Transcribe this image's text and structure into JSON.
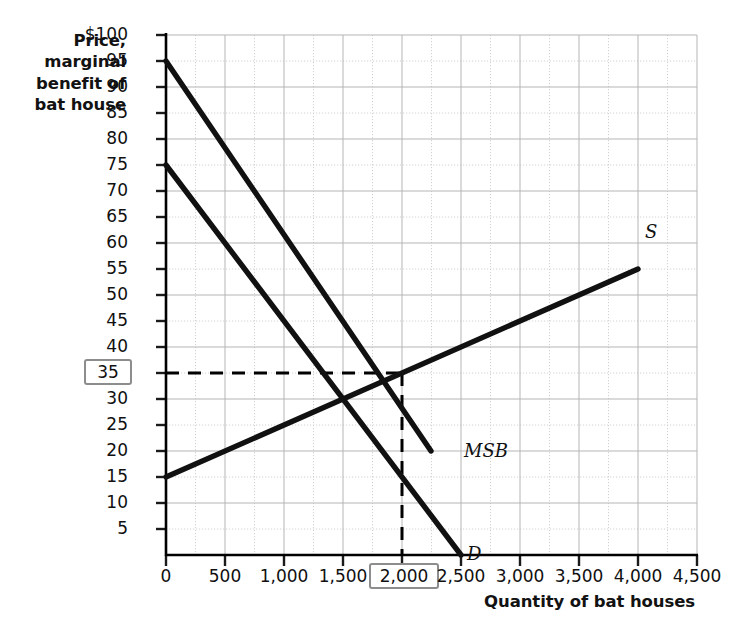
{
  "chart_data": {
    "type": "line",
    "title": "",
    "xlabel": "Quantity of bat houses",
    "ylabel": "Price, marginal benefit of bat house",
    "xlim": [
      0,
      4500
    ],
    "ylim": [
      0,
      100
    ],
    "grid": "major solid every 500 (x) / 10 (y), minor dotted every 250 (x) / 5 (y)",
    "legend": "inline curve labels at line ends",
    "xticks": [
      "0",
      "500",
      "1,000",
      "1,500",
      "2,000",
      "2,500",
      "3,000",
      "3,500",
      "4,000",
      "4,500"
    ],
    "xtick_values": [
      0,
      500,
      1000,
      1500,
      2000,
      2500,
      3000,
      3500,
      4000,
      4500
    ],
    "yticks": [
      "$100",
      "95",
      "90",
      "85",
      "80",
      "75",
      "70",
      "65",
      "60",
      "55",
      "50",
      "45",
      "40",
      "35",
      "30",
      "25",
      "20",
      "15",
      "10",
      "5"
    ],
    "ytick_values": [
      100,
      95,
      90,
      85,
      80,
      75,
      70,
      65,
      60,
      55,
      50,
      45,
      40,
      35,
      30,
      25,
      20,
      15,
      10,
      5
    ],
    "highlighted_xtick": "2,000",
    "highlighted_ytick": "35",
    "series": [
      {
        "name": "MSB",
        "label": "MSB",
        "description": "Marginal social benefit curve",
        "points": [
          [
            0,
            95
          ],
          [
            2250,
            20
          ]
        ]
      },
      {
        "name": "D",
        "label": "D",
        "description": "Demand curve",
        "points": [
          [
            0,
            75
          ],
          [
            2500,
            0
          ]
        ]
      },
      {
        "name": "S",
        "label": "S",
        "description": "Supply curve",
        "points": [
          [
            0,
            15
          ],
          [
            4000,
            55
          ]
        ]
      }
    ],
    "annotations": [
      {
        "name": "socially-optimal-equilibrium",
        "x": 2000,
        "y": 35,
        "style": "dashed guide lines to both axes"
      }
    ],
    "market_equilibrium": {
      "x": 1500,
      "y": 30
    },
    "colors": {
      "curve": "#000000",
      "grid_major": "#b9b9b9",
      "grid_minor": "#cfcfcf",
      "axis": "#000000",
      "highlight_box": "#8d8d8d",
      "text": "#101010"
    }
  }
}
